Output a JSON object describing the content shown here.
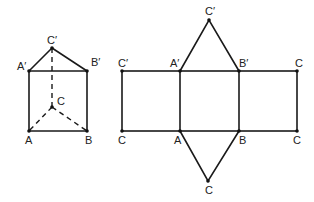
{
  "prism": {
    "title": "Triangular prism",
    "labels": {
      "A_prime": "A′",
      "B_prime": "B′",
      "C_prime": "C′",
      "C": "C",
      "A": "A",
      "B": "B"
    }
  },
  "net": {
    "title": "Net of triangular prism",
    "labels": {
      "top_apex": "C′",
      "top_left": "C′",
      "top_A": "A′",
      "top_B": "B′",
      "top_right": "C",
      "bottom_left": "C",
      "bottom_A": "A",
      "bottom_B": "B",
      "bottom_right": "C",
      "bottom_apex": "C"
    }
  }
}
